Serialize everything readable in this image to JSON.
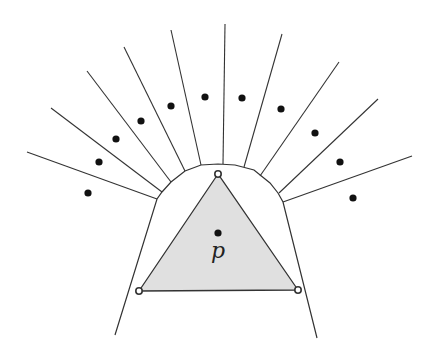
{
  "diagram": {
    "colors": {
      "line": "#333333",
      "fill": "#e0e0e0",
      "dot": "#111111"
    },
    "triangle": {
      "vertices": [
        [
          218,
          174
        ],
        [
          139,
          291
        ],
        [
          298,
          290
        ]
      ]
    },
    "center_point": {
      "x": 218,
      "y": 233,
      "label": "p",
      "label_x": 218,
      "label_y": 250
    },
    "boundary": [
      [
        115,
        335
      ],
      [
        157,
        199
      ],
      [
        162,
        192
      ],
      [
        171,
        182
      ],
      [
        185,
        171
      ],
      [
        201,
        165
      ],
      [
        218,
        164
      ],
      [
        235,
        165
      ],
      [
        254,
        170
      ],
      [
        270,
        183
      ],
      [
        278,
        193
      ],
      [
        283,
        202
      ],
      [
        317,
        338
      ]
    ],
    "rays": [
      [
        [
          157,
          199
        ],
        [
          27,
          152
        ]
      ],
      [
        [
          162,
          192
        ],
        [
          51,
          108
        ]
      ],
      [
        [
          171,
          182
        ],
        [
          87,
          71
        ]
      ],
      [
        [
          185,
          171
        ],
        [
          124,
          47
        ]
      ],
      [
        [
          201,
          165
        ],
        [
          171,
          30
        ]
      ],
      [
        [
          223,
          164
        ],
        [
          225,
          24
        ]
      ],
      [
        [
          244,
          167
        ],
        [
          282,
          34
        ]
      ],
      [
        [
          260,
          176
        ],
        [
          339,
          62
        ]
      ],
      [
        [
          279,
          193
        ],
        [
          378,
          99
        ]
      ],
      [
        [
          283,
          202
        ],
        [
          412,
          156
        ]
      ]
    ],
    "points": [
      [
        88,
        193
      ],
      [
        99,
        162
      ],
      [
        116,
        139
      ],
      [
        141,
        121
      ],
      [
        171,
        106
      ],
      [
        205,
        97
      ],
      [
        242,
        98
      ],
      [
        281,
        109
      ],
      [
        315,
        133
      ],
      [
        340,
        162
      ],
      [
        353,
        198
      ]
    ]
  }
}
